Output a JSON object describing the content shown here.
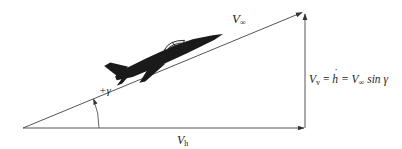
{
  "diagram": {
    "title": "",
    "colors": {
      "line": "#444444",
      "aircraft": "#1a1a1a",
      "background": "#ffffff"
    },
    "labels": {
      "v_infinity_main": "V",
      "v_infinity_sub": "∞",
      "gamma_angle": "+γ",
      "v_h_main": "V",
      "v_h_sub": "h",
      "v_v_main": "V",
      "v_v_sub": "v",
      "v_v_eq1": " = ",
      "v_v_hdot": "h",
      "v_v_eq2": " = V",
      "v_v_inf_sub": "∞",
      "v_v_tail": " sin γ"
    },
    "elements": {
      "hypotenuse": {
        "name": "flight-velocity-vector",
        "from": [
          23,
          128
        ],
        "to": [
          303,
          12
        ]
      },
      "horizontal": {
        "name": "horizontal-velocity-vector",
        "from": [
          23,
          128
        ],
        "to": [
          305,
          128
        ]
      },
      "vertical": {
        "name": "vertical-velocity-vector",
        "from": [
          305,
          128
        ],
        "to": [
          305,
          13
        ]
      },
      "angle_arc": {
        "name": "flight-path-angle-arc",
        "center": [
          23,
          128
        ],
        "radius": 76
      },
      "aircraft": {
        "name": "jet-aircraft-silhouette",
        "description": "jet trainer climbing along velocity vector"
      }
    }
  }
}
